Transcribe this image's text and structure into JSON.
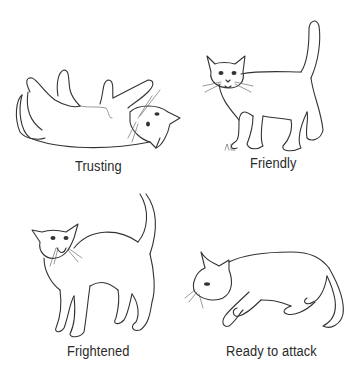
{
  "figure": {
    "panels": [
      {
        "id": "trusting",
        "caption": "Trusting",
        "icon": "cat-lying-on-back-illustration"
      },
      {
        "id": "friendly",
        "caption": "Friendly",
        "icon": "cat-standing-tail-up-illustration"
      },
      {
        "id": "frightened",
        "caption": "Frightened",
        "icon": "cat-arched-back-illustration"
      },
      {
        "id": "ready",
        "caption": "Ready to attack",
        "icon": "cat-crouching-illustration"
      }
    ],
    "colors": {
      "line": "#333333",
      "text": "#2a2a2a",
      "background": "#ffffff"
    }
  }
}
